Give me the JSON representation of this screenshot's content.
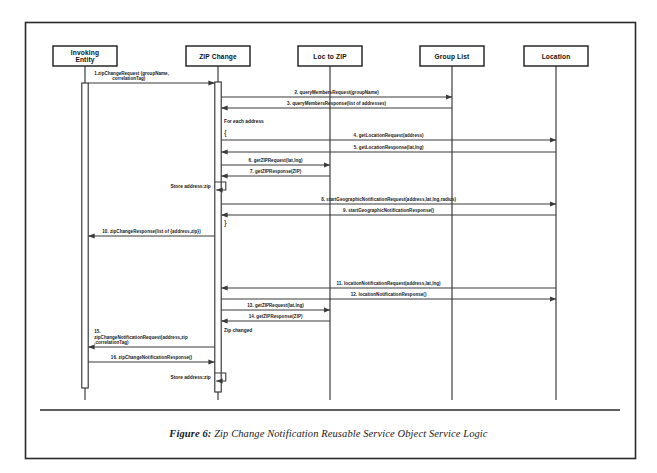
{
  "figure": {
    "caption_prefix": "Figure 6:",
    "caption_text": "Zip Change Notification Reusable Service Object Service Logic",
    "border_color": "#2a2a2a",
    "background": "#ffffff"
  },
  "lifelines": [
    {
      "id": "invoking-entity",
      "label_line1": "Invoking",
      "label_line2": "Entity",
      "x": 85
    },
    {
      "id": "zip-change",
      "label_line1": "ZIP Change",
      "label_line2": "",
      "x": 218
    },
    {
      "id": "loc-to-zip",
      "label_line1": "Loc to ZIP",
      "label_line2": "",
      "x": 330
    },
    {
      "id": "group-list",
      "label_line1": "Group List",
      "label_line2": "",
      "x": 452
    },
    {
      "id": "location",
      "label_line1": "Location",
      "label_line2": "",
      "x": 556
    }
  ],
  "messages": [
    {
      "num": "1",
      "label": "1.zipChangeRequest (groupName,",
      "label2": "correlationTag)",
      "from": "invoking-entity",
      "to": "zip-change",
      "y": 83,
      "dir": "right"
    },
    {
      "num": "2",
      "label": "2. queryMembersRequest(groupName)",
      "label2": "",
      "from": "zip-change",
      "to": "group-list",
      "y": 97,
      "dir": "right"
    },
    {
      "num": "3",
      "label": "3. queryMembersResponse(list of addresses)",
      "label2": "",
      "from": "group-list",
      "to": "zip-change",
      "y": 108,
      "dir": "left"
    },
    {
      "num": "4",
      "label": "4. getLocationRequest(address)",
      "label2": "",
      "from": "zip-change",
      "to": "location",
      "y": 140,
      "dir": "right"
    },
    {
      "num": "5",
      "label": "5. getLocationResponse(lat,lng)",
      "label2": "",
      "from": "location",
      "to": "zip-change",
      "y": 152,
      "dir": "left"
    },
    {
      "num": "6",
      "label": "6. getZIPRequest(lat,lng)",
      "label2": "",
      "from": "zip-change",
      "to": "loc-to-zip",
      "y": 165,
      "dir": "right"
    },
    {
      "num": "7",
      "label": "7. getZIPResponse(ZIP)",
      "label2": "",
      "from": "loc-to-zip",
      "to": "zip-change",
      "y": 176,
      "dir": "left"
    },
    {
      "num": "8",
      "label": "8. startGeographicNotificationRequest(address,lat,lng,radius)",
      "label2": "",
      "from": "zip-change",
      "to": "location",
      "y": 204,
      "dir": "right"
    },
    {
      "num": "9",
      "label": "9. startGeographicNotificationResponse()",
      "label2": "",
      "from": "location",
      "to": "zip-change",
      "y": 215,
      "dir": "left"
    },
    {
      "num": "10",
      "label": "10. zipChangeResponse(list of {address,zip})",
      "label2": "",
      "from": "zip-change",
      "to": "invoking-entity",
      "y": 236,
      "dir": "left"
    },
    {
      "num": "11",
      "label": "11. locationNotificationRequest(address,lat,lng)",
      "label2": "",
      "from": "location",
      "to": "zip-change",
      "y": 288,
      "dir": "left"
    },
    {
      "num": "12",
      "label": "12. locationNotificationResponse()",
      "label2": "",
      "from": "zip-change",
      "to": "location",
      "y": 299,
      "dir": "right"
    },
    {
      "num": "13",
      "label": "13. getZIPRequest(lat,lng)",
      "label2": "",
      "from": "zip-change",
      "to": "loc-to-zip",
      "y": 310,
      "dir": "right"
    },
    {
      "num": "14",
      "label": "14. getZIPResponse(ZIP)",
      "label2": "",
      "from": "loc-to-zip",
      "to": "zip-change",
      "y": 321,
      "dir": "left"
    },
    {
      "num": "15",
      "label": "15.",
      "label2": "zipChangeNotificationRequest(address,zip",
      "label3": ",correlationTag)",
      "from": "zip-change",
      "to": "invoking-entity",
      "y": 347,
      "dir": "left"
    },
    {
      "num": "16",
      "label": "16. zipChangeNotificationResponse()",
      "label2": "",
      "from": "invoking-entity",
      "to": "zip-change",
      "y": 362,
      "dir": "right"
    }
  ],
  "self_actions": [
    {
      "id": "store-address-zip-1",
      "label": "Store address:zip",
      "x": 218,
      "y": 190
    },
    {
      "id": "store-address-zip-2",
      "label": "Store address:zip",
      "x": 218,
      "y": 381
    }
  ],
  "notes": [
    {
      "id": "for-each-address",
      "label": "For each address",
      "x": 224,
      "y": 123
    },
    {
      "id": "loop-open-brace",
      "label": "{",
      "x": 224,
      "y": 135
    },
    {
      "id": "loop-close-brace",
      "label": "}",
      "x": 224,
      "y": 225
    },
    {
      "id": "zip-changed",
      "label": "Zip changed",
      "x": 224,
      "y": 332
    }
  ]
}
